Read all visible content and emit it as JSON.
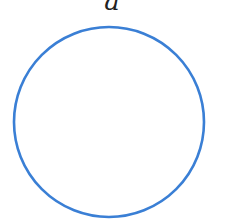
{
  "diagram": {
    "label": "a",
    "shape": "circle",
    "stroke_color": "#3a7fd5",
    "center": [
      109,
      122
    ],
    "radius": 95
  }
}
